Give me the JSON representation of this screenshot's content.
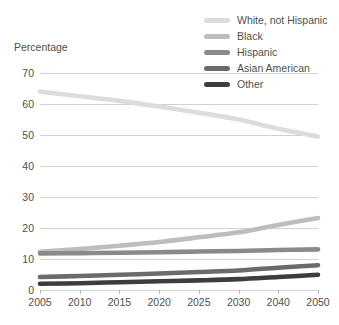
{
  "axis_title": "Percentage",
  "legend": {
    "items": [
      {
        "label": "White, not Hispanic",
        "color": "#dcdcdc"
      },
      {
        "label": "Black",
        "color": "#bdbdbd"
      },
      {
        "label": "Hispanic",
        "color": "#8a8a8a"
      },
      {
        "label": "Asian American",
        "color": "#6b6b6b"
      },
      {
        "label": "Other",
        "color": "#3d3d3d"
      }
    ]
  },
  "chart_data": {
    "type": "line",
    "title": "",
    "xlabel": "",
    "ylabel": "Percentage",
    "x": [
      2005,
      2010,
      2015,
      2020,
      2025,
      2030,
      2040,
      2050
    ],
    "xtick_labels": [
      "2005",
      "2010",
      "2015",
      "2020",
      "2025",
      "2030",
      "2040",
      "2050"
    ],
    "ytick_labels": [
      "0",
      "10",
      "20",
      "30",
      "40",
      "50",
      "60",
      "70"
    ],
    "yticks": [
      0,
      10,
      20,
      30,
      40,
      50,
      60,
      70
    ],
    "ylim": [
      0,
      70
    ],
    "grid": true,
    "legend_position": "top-right",
    "series": [
      {
        "name": "White, not Hispanic",
        "color": "#dcdcdc",
        "values": [
          64.0,
          62.5,
          61.0,
          59.2,
          57.2,
          55.0,
          52.0,
          49.5
        ]
      },
      {
        "name": "Hispanic",
        "color": "#bdbdbd",
        "values": [
          12.3,
          13.2,
          14.3,
          15.5,
          17.0,
          18.6,
          21.0,
          23.2
        ]
      },
      {
        "name": "Black",
        "color": "#8a8a8a",
        "values": [
          11.8,
          11.9,
          12.0,
          12.2,
          12.4,
          12.6,
          12.9,
          13.1
        ]
      },
      {
        "name": "Asian American",
        "color": "#6b6b6b",
        "values": [
          4.2,
          4.5,
          4.9,
          5.3,
          5.8,
          6.3,
          7.2,
          8.0
        ]
      },
      {
        "name": "Other",
        "color": "#3d3d3d",
        "values": [
          2.0,
          2.2,
          2.5,
          2.8,
          3.1,
          3.5,
          4.2,
          4.9
        ]
      }
    ]
  }
}
